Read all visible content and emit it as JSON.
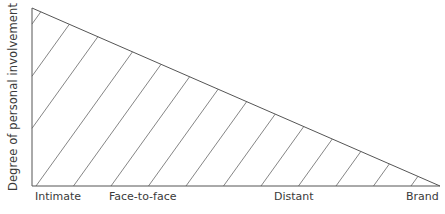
{
  "diagram": {
    "type": "hatched-triangle",
    "y_axis_label": "Degree of personal involvement",
    "x_axis_labels": [
      {
        "text": "Intimate",
        "x": 35
      },
      {
        "text": "Face-to-face",
        "x": 109
      },
      {
        "text": "Distant",
        "x": 274
      },
      {
        "text": "Brand",
        "x": 406
      }
    ],
    "colors": {
      "line": "#555555",
      "hatch": "#666666",
      "text": "#3a3a3a",
      "background": "#ffffff"
    },
    "triangle": {
      "top_left": [
        32,
        8
      ],
      "bottom_left": [
        32,
        186
      ],
      "bottom_right": [
        440,
        186
      ]
    },
    "hatch": {
      "baseline_start": 36,
      "spacing": 37.5,
      "count": 12,
      "slope_dy_dx": 1.39
    }
  }
}
